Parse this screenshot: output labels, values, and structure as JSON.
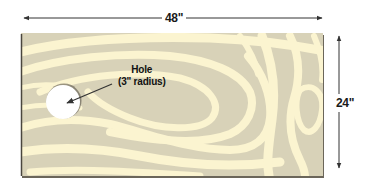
{
  "diagram": {
    "board": {
      "width_label": "48\"",
      "height_label": "24\"",
      "color_base": "#d8d2b8",
      "color_grain": "#fbf4d0",
      "edge_color": "#4a463e"
    },
    "hole": {
      "label_line1": "Hole",
      "label_line2": "(3\" radius)",
      "fill": "#ffffff"
    },
    "arrows": {
      "color": "#333333"
    }
  }
}
